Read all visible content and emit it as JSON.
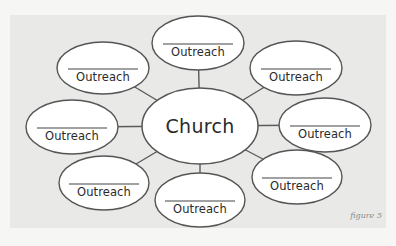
{
  "figure": {
    "caption": "figure 5",
    "colors": {
      "page_bg": "#f6f6f5",
      "panel_bg": "#e9e9e7",
      "ellipse_fill": "#ffffff",
      "stroke": "#555555",
      "text": "#2a2a2a"
    }
  },
  "center": {
    "label": "Church",
    "cx": 200,
    "cy": 126,
    "rx": 58,
    "ry": 38
  },
  "nodes": [
    {
      "id": "top",
      "label": "Outreach",
      "cx": 198,
      "cy": 43,
      "rx": 46,
      "ry": 27
    },
    {
      "id": "top-left",
      "label": "Outreach",
      "cx": 103,
      "cy": 68,
      "rx": 46,
      "ry": 26
    },
    {
      "id": "top-right",
      "label": "Outreach",
      "cx": 296,
      "cy": 68,
      "rx": 46,
      "ry": 27
    },
    {
      "id": "left",
      "label": "Outreach",
      "cx": 72,
      "cy": 127,
      "rx": 46,
      "ry": 27
    },
    {
      "id": "right",
      "label": "Outreach",
      "cx": 325,
      "cy": 125,
      "rx": 46,
      "ry": 27
    },
    {
      "id": "bottom-left",
      "label": "Outreach",
      "cx": 104,
      "cy": 183,
      "rx": 45,
      "ry": 27
    },
    {
      "id": "bottom-center",
      "label": "Outreach",
      "cx": 200,
      "cy": 200,
      "rx": 45,
      "ry": 27
    },
    {
      "id": "bottom-right",
      "label": "Outreach",
      "cx": 297,
      "cy": 177,
      "rx": 45,
      "ry": 27
    }
  ]
}
